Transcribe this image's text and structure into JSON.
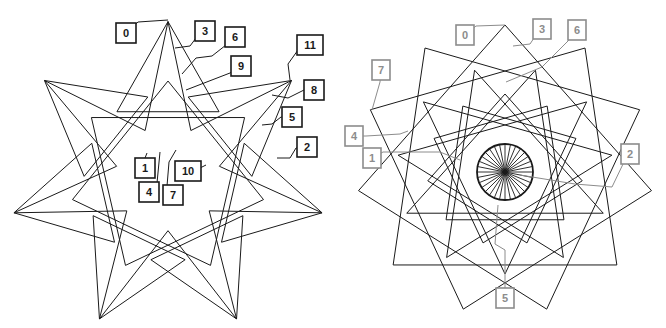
{
  "figures": [
    {
      "id": "left-star",
      "description": "7-pointed star line figure with numbered callouts",
      "label_color": "#1a1a1a",
      "labels": [
        "0",
        "3",
        "6",
        "9",
        "11",
        "8",
        "5",
        "2",
        "1",
        "10",
        "4",
        "7"
      ]
    },
    {
      "id": "right-star",
      "description": "12-fold overlapping star polygons with central radial circle and numbered callouts",
      "label_color": "#8c8c8c",
      "labels": [
        "0",
        "3",
        "6",
        "7",
        "4",
        "1",
        "2",
        "5"
      ]
    }
  ],
  "colors": {
    "line": "#1a1a1a",
    "background": "#ffffff",
    "right_callout": "#8c8c8c"
  }
}
